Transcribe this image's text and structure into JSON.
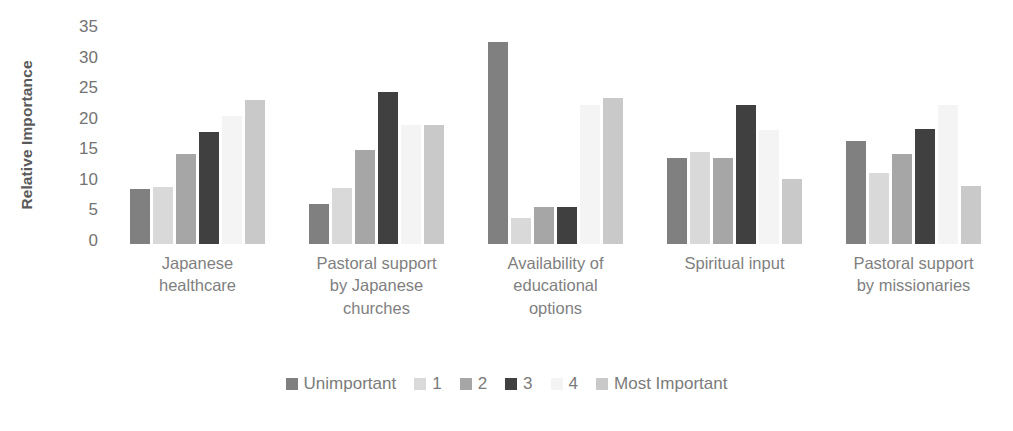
{
  "chart_data": {
    "type": "bar",
    "title": "",
    "xlabel": "",
    "ylabel": "Relative Importance",
    "ylim": [
      0,
      35
    ],
    "ytick_labels": [
      "35",
      "30",
      "25",
      "20",
      "15",
      "10",
      "5",
      "0"
    ],
    "ytick_values": [
      35,
      30,
      25,
      20,
      15,
      10,
      5,
      0
    ],
    "grid": false,
    "legend_position": "bottom",
    "categories": [
      "Japanese healthcare",
      "Pastoral support by Japanese churches",
      "Availability of educational options",
      "Spiritual input",
      "Pastoral support by missionaries"
    ],
    "series": [
      {
        "name": "Unimportant",
        "color": "#808080",
        "values": [
          9.0,
          6.5,
          33.0,
          14.1,
          16.8
        ]
      },
      {
        "name": "1",
        "color": "#d9d9d9",
        "values": [
          9.3,
          9.2,
          4.3,
          15.0,
          11.6
        ]
      },
      {
        "name": "2",
        "color": "#a6a6a6",
        "values": [
          14.8,
          15.4,
          6.0,
          14.1,
          14.8
        ]
      },
      {
        "name": "3",
        "color": "#404040",
        "values": [
          18.3,
          24.9,
          6.0,
          22.8,
          18.8
        ]
      },
      {
        "name": "4",
        "color": "#f4f4f4",
        "values": [
          21.0,
          19.4,
          22.7,
          18.6,
          22.8
        ]
      },
      {
        "name": "Most Important",
        "color": "#c9c9c9",
        "values": [
          23.6,
          19.4,
          23.8,
          10.7,
          9.5
        ]
      }
    ]
  },
  "categories_wrapped": [
    "Japanese\nhealthcare",
    "Pastoral support\nby Japanese\nchurches",
    "Availability of\neducational\noptions",
    "Spiritual input",
    "Pastoral support\nby missionaries"
  ],
  "axis": {
    "y_title": "Relative Importance"
  },
  "colors": {
    "text_gray": "#7f7f7f",
    "title_gray": "#595959",
    "background": "#ffffff"
  }
}
